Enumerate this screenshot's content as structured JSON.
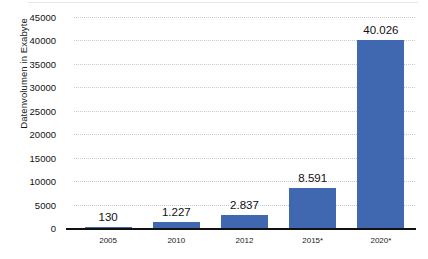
{
  "chart_data": {
    "type": "bar",
    "title": "",
    "xlabel": "",
    "ylabel": "Datenvolumen in Exabyte",
    "categories": [
      "2005",
      "2010",
      "2012",
      "2015*",
      "2020*"
    ],
    "values": [
      130,
      1227,
      2837,
      8591,
      40026
    ],
    "value_labels": [
      "130",
      "1.227",
      "2.837",
      "8.591",
      "40.026"
    ],
    "ylim": [
      0,
      45000
    ],
    "ytick_labels": [
      "0",
      "5000",
      "10000",
      "15000",
      "20000",
      "25000",
      "30000",
      "35000",
      "40000",
      "45000"
    ],
    "ytick_values": [
      0,
      5000,
      10000,
      15000,
      20000,
      25000,
      30000,
      35000,
      40000,
      45000
    ],
    "grid": true,
    "legend": "none",
    "series": [
      {
        "name": "Datenvolumen",
        "color": "#4068b0",
        "values": [
          130,
          1227,
          2837,
          8591,
          40026
        ]
      }
    ],
    "colors": {
      "bar": "#4068b0",
      "gridline": "#c9c9c9",
      "axis": "#111111",
      "text": "#111111",
      "background": "#ffffff"
    }
  }
}
